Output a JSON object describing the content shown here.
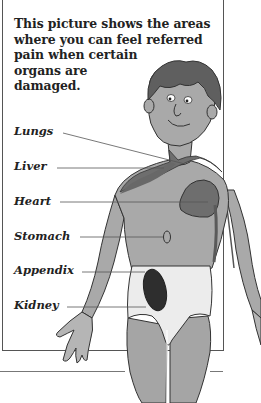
{
  "caption": {
    "lines": [
      "This picture shows the areas",
      "where you can feel referred",
      "pain when certain",
      "organs are",
      "damaged."
    ]
  },
  "labels": [
    {
      "name": "lungs",
      "text": "Lungs"
    },
    {
      "name": "liver",
      "text": "Liver"
    },
    {
      "name": "heart",
      "text": "Heart"
    },
    {
      "name": "stomach",
      "text": "Stomach"
    },
    {
      "name": "appendix",
      "text": "Appendix"
    },
    {
      "name": "kidney",
      "text": "Kidney"
    }
  ],
  "colors": {
    "skin": "#a9a9a9",
    "hair": "#5f5f5f",
    "pain_area_dark": "#6e6e6e",
    "pain_area_darkest": "#2e2e2e",
    "shorts": "#ececec",
    "outline": "#333333"
  }
}
